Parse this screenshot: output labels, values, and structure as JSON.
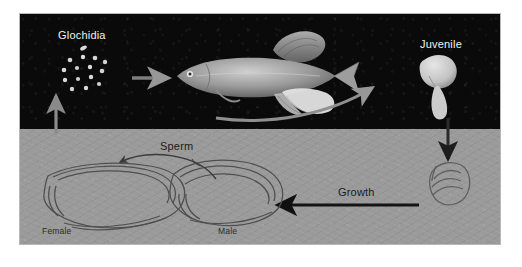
{
  "figure": {
    "frame": {
      "x": 20,
      "y": 14,
      "width": 480,
      "height": 230,
      "border_color": "#b8b8b8"
    },
    "panels": [
      {
        "name": "water-column",
        "fill": "#0a0a0a",
        "y": 0,
        "height": 115
      },
      {
        "name": "stream-bottom",
        "fill": "#9a9a9a",
        "y": 115,
        "height": 115
      }
    ]
  },
  "labels": {
    "glochidia": "Glochidia",
    "juvenile": "Juvenile",
    "sperm": "Sperm",
    "growth": "Growth",
    "female": "Female",
    "male": "Male"
  },
  "organisms": {
    "glochidia_cluster": {
      "name": "glochidia",
      "count": 13,
      "color": "#d9d9d9"
    },
    "host_fish": {
      "name": "host-fish",
      "color": "#9b9b9b"
    },
    "juvenile_mussel": {
      "name": "juvenile-mussel",
      "color": "#cfcfcf"
    },
    "growing_mussel": {
      "name": "growing-mussel",
      "outline": "#5a5a5a"
    },
    "female_mussel": {
      "name": "female-adult-mussel",
      "outline": "#555555"
    },
    "male_mussel": {
      "name": "male-adult-mussel",
      "outline": "#555555"
    }
  },
  "arrows": [
    {
      "name": "female-to-glochidia",
      "direction": "up",
      "color": "#8a8a8a",
      "panel": "both"
    },
    {
      "name": "glochidia-to-fish",
      "direction": "right",
      "color": "#7d7d7d",
      "panel": "water-column"
    },
    {
      "name": "fish-to-juvenile",
      "direction": "curve-right",
      "color": "#8f8f8f",
      "panel": "water-column"
    },
    {
      "name": "juvenile-to-bottom",
      "direction": "down",
      "color": "#2a2a2a",
      "panel": "both"
    },
    {
      "name": "growth-arrow",
      "direction": "left",
      "color": "#141414",
      "panel": "stream-bottom"
    },
    {
      "name": "sperm-arrow",
      "direction": "curve-left",
      "color": "#3a3a3a",
      "panel": "stream-bottom"
    }
  ],
  "colors": {
    "dark_panel": "#0a0a0a",
    "light_panel": "#9a9a9a",
    "light_text": "#f2f2f2",
    "dark_text": "#1b1b1b",
    "page_background": "#ffffff"
  }
}
